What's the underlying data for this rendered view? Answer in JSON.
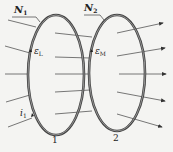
{
  "diagram": {
    "type": "mutual-inductance-coils",
    "coils": [
      {
        "id": "1",
        "turns_label": "N",
        "turns_sub": "1",
        "emf_label": "ε",
        "emf_sub": "L",
        "number": "1"
      },
      {
        "id": "2",
        "turns_label": "N",
        "turns_sub": "2",
        "emf_label": "ε",
        "emf_sub": "M",
        "number": "2"
      }
    ],
    "current_label": "i",
    "current_sub": "1",
    "colors": {
      "coil": "#444444",
      "field_line": "#555555",
      "background": "#f4f4f2"
    }
  }
}
